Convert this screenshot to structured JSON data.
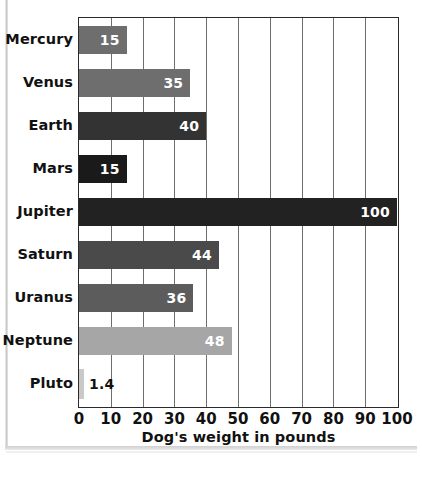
{
  "chart_data": {
    "type": "bar",
    "orientation": "horizontal",
    "title": "",
    "xlabel": "Dog's weight in pounds",
    "ylabel": "",
    "categories": [
      "Mercury",
      "Venus",
      "Earth",
      "Mars",
      "Jupiter",
      "Saturn",
      "Uranus",
      "Neptune",
      "Pluto"
    ],
    "values": [
      15,
      35,
      40,
      15,
      100,
      44,
      36,
      48,
      1.4
    ],
    "value_labels": [
      "15",
      "35",
      "40",
      "15",
      "100",
      "44",
      "36",
      "48",
      "1.4"
    ],
    "bar_colors": [
      "#6e6e6e",
      "#6e6e6e",
      "#333333",
      "#1a1a1a",
      "#222222",
      "#4a4a4a",
      "#5c5c5c",
      "#a6a6a6",
      "#c9c9c9"
    ],
    "label_inside": [
      true,
      true,
      true,
      true,
      true,
      true,
      true,
      true,
      false
    ],
    "xlim": [
      0,
      100
    ],
    "xticks": [
      0,
      10,
      20,
      30,
      40,
      50,
      60,
      70,
      80,
      90,
      100
    ],
    "xtick_labels": [
      "0",
      "10",
      "20",
      "30",
      "40",
      "50",
      "60",
      "70",
      "80",
      "90",
      "100"
    ],
    "grid": "vertical",
    "legend": "none",
    "axis_color": "#2b2b2b",
    "grid_color": "#6e6e6e",
    "background": "#ffffff"
  }
}
